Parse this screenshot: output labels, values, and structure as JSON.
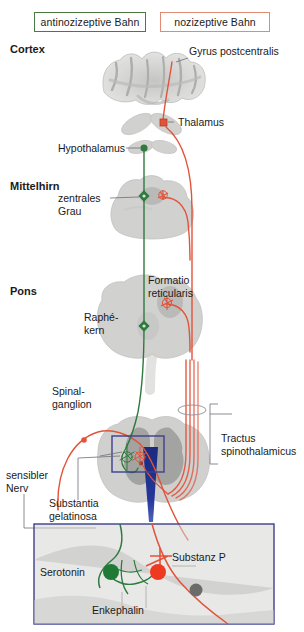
{
  "figure": {
    "legend": {
      "antinociceptive_label": "antinozizeptive Bahn",
      "antinociceptive_color": "#2f7a3d",
      "nociceptive_label": "nozizeptive Bahn",
      "nociceptive_color": "#e2533a"
    },
    "levels": [
      {
        "id": "cortex",
        "label": "Cortex"
      },
      {
        "id": "mittelhirn",
        "label": "Mittelhirn"
      },
      {
        "id": "pons",
        "label": "Pons"
      }
    ],
    "structures": [
      {
        "id": "gyrus-postcentralis",
        "label": "Gyrus postcentralis"
      },
      {
        "id": "thalamus",
        "label": "Thalamus"
      },
      {
        "id": "hypothalamus",
        "label": "Hypothalamus"
      },
      {
        "id": "zentrales-grau",
        "label": "zentrales\nGrau",
        "line1": "zentrales",
        "line2": "Grau"
      },
      {
        "id": "formatio-reticularis",
        "label": "Formatio reticularis",
        "line1": "Formatio",
        "line2": "reticularis"
      },
      {
        "id": "raphe-kern",
        "label": "Raphé-kern",
        "line1": "Raphé-",
        "line2": "kern"
      },
      {
        "id": "spinalganglion",
        "label": "Spinalganglion",
        "line1": "Spinal-",
        "line2": "ganglion"
      },
      {
        "id": "sensibler-nerv",
        "label": "sensibler Nerv",
        "line1": "sensibler",
        "line2": "Nerv"
      },
      {
        "id": "substantia-gelatinosa",
        "label": "Substantia gelatinosa",
        "line1": "Substantia",
        "line2": "gelatinosa"
      },
      {
        "id": "tractus-spinothalamicus",
        "label": "Tractus spinothalamicus",
        "line1": "Tractus",
        "line2": "spinothalamicus"
      }
    ],
    "inset": {
      "transmitters": [
        {
          "id": "serotonin",
          "label": "Serotonin",
          "color": "#1f7a36",
          "marker": "filled-circle"
        },
        {
          "id": "substanz-p",
          "label": "Substanz P",
          "color": "#ee3a20",
          "marker": "filled-circle"
        },
        {
          "id": "enkephalin",
          "label": "Enkephalin",
          "color": "#2f7a3d",
          "marker": "interneuron"
        },
        {
          "id": "projection-neuron",
          "label": "",
          "color": "#6b6b6b",
          "marker": "filled-circle"
        }
      ],
      "border_color": "#3c3f8f"
    },
    "colors": {
      "tissue_gray": "#c9c9c7",
      "tissue_gray_dark": "#9e9e9c",
      "blue_wedge": "#1f2f86",
      "zoom_box_border": "#3c3f8f",
      "leader_line": "#6e6e78"
    }
  }
}
